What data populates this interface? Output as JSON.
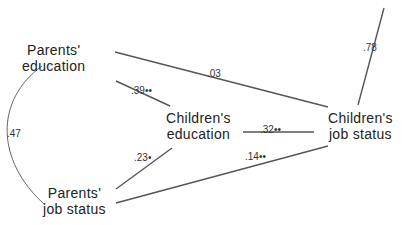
{
  "nodes": {
    "parents_education": {
      "line1": "Parents'",
      "line2": "education"
    },
    "parents_job_status": {
      "line1": "Parents'",
      "line2": "job status"
    },
    "childrens_education": {
      "line1": "Children's",
      "line2": "education"
    },
    "childrens_job_status": {
      "line1": "Children's",
      "line2": "job status"
    }
  },
  "paths": {
    "pe_to_cj": ".03",
    "pe_to_ce": ".39••",
    "pj_to_ce": ".23•",
    "ce_to_cj": ".32••",
    "pj_to_cj": ".14••",
    "residual_cj": ".78",
    "pe_pj_correlation": ".47"
  },
  "colors": {
    "line": "#555555",
    "text": "#222222"
  }
}
